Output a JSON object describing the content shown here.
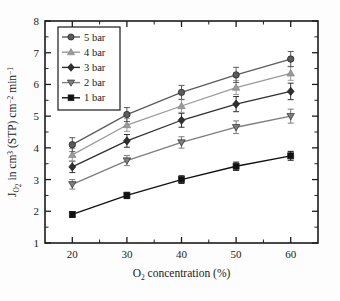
{
  "chart_data": {
    "type": "line",
    "title": "",
    "xlabel": "O2 concentration (%)",
    "xlabel_parts": {
      "pre": "O",
      "sub": "2",
      "post": " concentration (%)"
    },
    "ylabel": "JO2 in cm3 (STP) cm-2 min-1",
    "ylabel_parts": {
      "j": "J",
      "j_sub": "O",
      "j_sub_sub": "2",
      "mid": " in cm",
      "sup1": "3",
      "mid2": " (STP) cm",
      "sup2": "−2",
      "mid3": " min",
      "sup3": "−1"
    },
    "x": [
      20,
      30,
      40,
      50,
      60
    ],
    "xlim": [
      15,
      65
    ],
    "ylim": [
      1,
      8
    ],
    "xticks": [
      20,
      30,
      40,
      50,
      60
    ],
    "yticks": [
      1,
      2,
      3,
      4,
      5,
      6,
      7,
      8
    ],
    "x_minor_step": 5,
    "y_minor_step": 0.5,
    "grid": false,
    "legend_position": "top-left",
    "series": [
      {
        "name": "5 bar",
        "marker": "circle",
        "color": "#5b5b5b",
        "values": [
          4.1,
          5.05,
          5.75,
          6.3,
          6.8
        ],
        "errors": [
          0.22,
          0.22,
          0.22,
          0.24,
          0.24
        ]
      },
      {
        "name": "4 bar",
        "marker": "triangle-up",
        "color": "#9a9a9a",
        "values": [
          3.78,
          4.72,
          5.32,
          5.9,
          6.35
        ],
        "errors": [
          0.2,
          0.2,
          0.2,
          0.22,
          0.22
        ]
      },
      {
        "name": "3 bar",
        "marker": "diamond",
        "color": "#303030",
        "values": [
          3.4,
          4.22,
          4.87,
          5.38,
          5.78
        ],
        "errors": [
          0.18,
          0.2,
          0.22,
          0.24,
          0.26
        ]
      },
      {
        "name": "2 bar",
        "marker": "triangle-down",
        "color": "#7d7d7d",
        "values": [
          2.85,
          3.6,
          4.17,
          4.65,
          5.0
        ],
        "errors": [
          0.15,
          0.16,
          0.18,
          0.2,
          0.22
        ]
      },
      {
        "name": "1 bar",
        "marker": "square",
        "color": "#111111",
        "values": [
          1.9,
          2.5,
          3.0,
          3.42,
          3.75
        ],
        "errors": [
          0.09,
          0.1,
          0.12,
          0.13,
          0.14
        ]
      }
    ]
  }
}
